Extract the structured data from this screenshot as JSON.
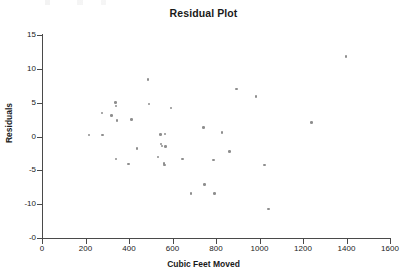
{
  "chart_data": {
    "type": "scatter",
    "title": "Residual Plot",
    "xlabel": "Cubic Feet Moved",
    "ylabel": "Residuals",
    "xlim": [
      0,
      1600
    ],
    "ylim": [
      -15,
      15
    ],
    "grid": false,
    "legend": null,
    "marker_color": "#8e8e8e",
    "axis_color": "#4a4a4a",
    "text_color": "#1a1a1a",
    "xticks": [
      0,
      200,
      400,
      600,
      800,
      1000,
      1200,
      1400,
      1600
    ],
    "xtick_labels": [
      "0",
      "200",
      "400",
      "600",
      "800",
      "1000",
      "1200",
      "1400",
      "1600"
    ],
    "yticks": [
      15,
      10,
      5,
      0,
      -5,
      -10,
      -15
    ],
    "ytick_labels": [
      "15",
      "10",
      "5",
      "0",
      "-5",
      "-10",
      "-0"
    ],
    "points": [
      {
        "x": 215,
        "y": 0.2
      },
      {
        "x": 275,
        "y": 3.5
      },
      {
        "x": 278,
        "y": 0.2
      },
      {
        "x": 320,
        "y": 3.1
      },
      {
        "x": 338,
        "y": 5.0
      },
      {
        "x": 340,
        "y": 4.5
      },
      {
        "x": 345,
        "y": 2.4
      },
      {
        "x": 340,
        "y": -3.3
      },
      {
        "x": 398,
        "y": -4.1
      },
      {
        "x": 412,
        "y": 2.5
      },
      {
        "x": 437,
        "y": -1.8
      },
      {
        "x": 488,
        "y": 8.4
      },
      {
        "x": 492,
        "y": 4.8
      },
      {
        "x": 533,
        "y": -3.0
      },
      {
        "x": 545,
        "y": 0.3
      },
      {
        "x": 548,
        "y": -1.1
      },
      {
        "x": 552,
        "y": -1.4
      },
      {
        "x": 565,
        "y": 0.4
      },
      {
        "x": 567,
        "y": -1.5
      },
      {
        "x": 560,
        "y": -4.0
      },
      {
        "x": 563,
        "y": -4.2
      },
      {
        "x": 592,
        "y": 4.2
      },
      {
        "x": 645,
        "y": -3.3
      },
      {
        "x": 685,
        "y": -8.4
      },
      {
        "x": 742,
        "y": 1.3
      },
      {
        "x": 748,
        "y": -7.1
      },
      {
        "x": 788,
        "y": -3.5
      },
      {
        "x": 792,
        "y": -8.4
      },
      {
        "x": 828,
        "y": 0.6
      },
      {
        "x": 862,
        "y": -2.2
      },
      {
        "x": 895,
        "y": 7.0
      },
      {
        "x": 985,
        "y": 5.9
      },
      {
        "x": 1022,
        "y": -4.2
      },
      {
        "x": 1042,
        "y": -10.7
      },
      {
        "x": 1240,
        "y": 2.1
      },
      {
        "x": 1398,
        "y": 11.8
      }
    ]
  }
}
